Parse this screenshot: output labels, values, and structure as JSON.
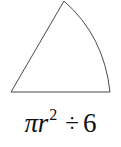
{
  "figure": {
    "name": "circular-sector-sketch",
    "stroke_color": "#4a4a4a",
    "fill_color": "#ffffff",
    "background_color": "#ffffff",
    "apex": {
      "x": 64,
      "y": 1
    },
    "bottom_left": {
      "x": 11,
      "y": 92
    },
    "bottom_right": {
      "x": 110,
      "y": 92
    },
    "arc_control": {
      "x": 104,
      "y": 36
    },
    "stroke_width": 1
  },
  "formula": {
    "full_text": "πr² ÷ 6",
    "pi_symbol": "π",
    "radius_variable": "r",
    "exponent": "2",
    "operator": "÷",
    "operand": "6",
    "text_color": "#111111"
  }
}
